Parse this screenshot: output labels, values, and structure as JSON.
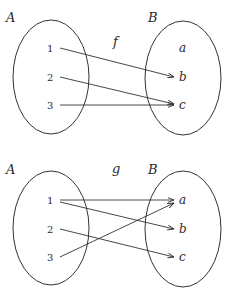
{
  "diagrams": [
    {
      "function_label": "f",
      "domain_label": "A",
      "codomain_label": "B",
      "domain_elements": [
        "1",
        "2",
        "3"
      ],
      "codomain_elements": [
        "a",
        "b",
        "c"
      ],
      "mappings": [
        {
          "from": "1",
          "to": "b"
        },
        {
          "from": "2",
          "to": "c"
        },
        {
          "from": "3",
          "to": "c"
        }
      ]
    },
    {
      "function_label": "g",
      "domain_label": "A",
      "codomain_label": "B",
      "domain_elements": [
        "1",
        "2",
        "3"
      ],
      "codomain_elements": [
        "a",
        "b",
        "c"
      ],
      "mappings": [
        {
          "from": "1",
          "to": "a"
        },
        {
          "from": "1",
          "to": "b"
        },
        {
          "from": "2",
          "to": "c"
        },
        {
          "from": "3",
          "to": "a"
        }
      ]
    }
  ],
  "colors": {
    "stroke": "#333333",
    "text": "#2a2a2a",
    "background": "#ffffff"
  }
}
